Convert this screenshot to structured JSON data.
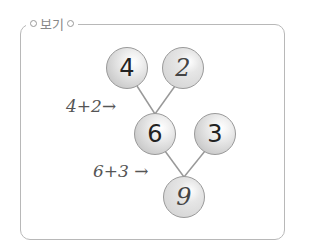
{
  "title": "보기",
  "tree": {
    "a": "4",
    "b": "2",
    "sum1": "6",
    "c": "3",
    "sum2": "9"
  },
  "labels": {
    "first": "4+2→",
    "second": "6+3 →"
  }
}
